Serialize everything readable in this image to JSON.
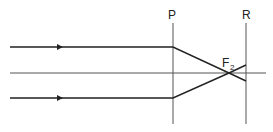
{
  "diagram": {
    "type": "optics-ray-diagram",
    "planes": [
      {
        "label": "P"
      },
      {
        "label": "R"
      }
    ],
    "focus": {
      "label": "F",
      "subscript": "2"
    },
    "elements": [
      "principal-axis",
      "upper-incident-ray",
      "lower-incident-ray",
      "lens-plane-P",
      "screen-plane-R"
    ],
    "colors": {
      "ray": "#222222",
      "axis": "#555555",
      "plane": "#555555"
    }
  }
}
